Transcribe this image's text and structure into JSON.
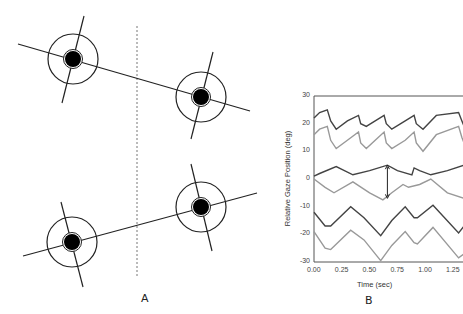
{
  "panels": {
    "a": {
      "label": "A",
      "description": "Four eye diagrams (pupil with iris ring and cross lines) with connecting gaze lines; dashed vertical midline",
      "eyes": [
        {
          "cx": 73,
          "cy": 59,
          "r": 25,
          "pupil_r": 8
        },
        {
          "cx": 201,
          "cy": 97,
          "r": 25,
          "pupil_r": 8
        },
        {
          "cx": 72,
          "cy": 242,
          "r": 25,
          "pupil_r": 8
        },
        {
          "cx": 201,
          "cy": 207,
          "r": 25,
          "pupil_r": 8
        }
      ]
    },
    "b": {
      "label": "B"
    }
  },
  "chart_data": {
    "type": "line",
    "title": "",
    "xlabel": "Time (sec)",
    "ylabel": "Relative Gaze Position (deg)",
    "xlim": [
      0,
      1.35
    ],
    "ylim": [
      -30,
      30
    ],
    "x_ticks": [
      "0.00",
      "0.25",
      "0.50",
      "0.75",
      "1.00",
      "1.25"
    ],
    "y_ticks": [
      "30",
      "20",
      "10",
      "0",
      "-10",
      "-20",
      "-30"
    ],
    "grid": false,
    "legend": null,
    "annotations": [
      {
        "type": "double-arrow",
        "x": 0.66,
        "y_from": 5,
        "y_to": -7
      }
    ],
    "series": [
      {
        "name": "pair1-dark",
        "color": "#444444",
        "x": [
          0,
          0.05,
          0.12,
          0.15,
          0.2,
          0.3,
          0.4,
          0.42,
          0.47,
          0.55,
          0.63,
          0.65,
          0.7,
          0.82,
          0.9,
          0.92,
          0.98,
          1.1,
          1.3,
          1.33,
          1.35
        ],
        "y": [
          22,
          24,
          25,
          21,
          18,
          21,
          23,
          20,
          19,
          21,
          23,
          20,
          18,
          21,
          23,
          20,
          18,
          23,
          24,
          21,
          19
        ]
      },
      {
        "name": "pair1-light",
        "color": "#999999",
        "x": [
          0,
          0.05,
          0.12,
          0.15,
          0.2,
          0.3,
          0.4,
          0.42,
          0.47,
          0.55,
          0.63,
          0.65,
          0.7,
          0.82,
          0.9,
          0.92,
          0.98,
          1.1,
          1.3,
          1.33,
          1.35
        ],
        "y": [
          16,
          18,
          19,
          14,
          11,
          14,
          17,
          13,
          11,
          14,
          17,
          13,
          11,
          14,
          17,
          13,
          10,
          16,
          19,
          15,
          13
        ]
      },
      {
        "name": "pair2-dark",
        "color": "#444444",
        "x": [
          0,
          0.05,
          0.2,
          0.35,
          0.5,
          0.66,
          0.75,
          0.88,
          0.9,
          0.95,
          1.05,
          1.2,
          1.35
        ],
        "y": [
          1,
          2,
          4.5,
          1.5,
          3,
          5,
          3,
          1.5,
          4,
          3,
          1.5,
          3,
          5
        ]
      },
      {
        "name": "pair2-light",
        "color": "#999999",
        "x": [
          0,
          0.1,
          0.18,
          0.35,
          0.5,
          0.62,
          0.7,
          0.8,
          0.85,
          0.95,
          1.05,
          1.2,
          1.35
        ],
        "y": [
          0,
          -3,
          -5,
          -1,
          -5,
          -7.5,
          -5,
          -2,
          -3,
          -2,
          0,
          -5,
          -7
        ]
      },
      {
        "name": "pair3-dark",
        "color": "#444444",
        "x": [
          0,
          0.1,
          0.15,
          0.33,
          0.45,
          0.6,
          0.7,
          0.82,
          0.9,
          0.93,
          1.07,
          1.3,
          1.35
        ],
        "y": [
          -12,
          -17,
          -17,
          -10,
          -14,
          -20.5,
          -15,
          -10,
          -14,
          -14,
          -9.5,
          -19.5,
          -17
        ]
      },
      {
        "name": "pair4-light",
        "color": "#999999",
        "x": [
          0,
          0.1,
          0.15,
          0.33,
          0.45,
          0.6,
          0.7,
          0.82,
          0.9,
          0.93,
          1.07,
          1.3,
          1.35
        ],
        "y": [
          -19,
          -25,
          -25.5,
          -18.5,
          -22,
          -29.5,
          -24,
          -19,
          -23,
          -23.5,
          -17.5,
          -28.5,
          -27
        ]
      }
    ]
  }
}
